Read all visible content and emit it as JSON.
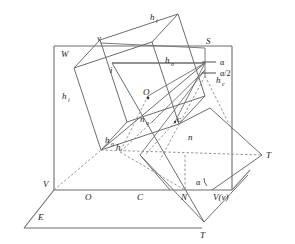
{
  "figure": {
    "background_color": "#ffffff",
    "line_color": "#4d4d4d",
    "dashed_color": "#6e6e6e",
    "label_color": "#1a1a1a",
    "width": 295,
    "height": 244
  },
  "labels": {
    "h_i_top": {
      "base": "h",
      "sub": "i"
    },
    "h_i_left": {
      "base": "h",
      "sub": "i"
    },
    "h_o_upper": {
      "base": "h",
      "sub": "o"
    },
    "h_o_lower": {
      "base": "h",
      "sub": "o"
    },
    "h_c": {
      "base": "h",
      "sub": "c"
    },
    "h_plain": {
      "base": "h",
      "sub": ""
    },
    "n_o": {
      "base": "n",
      "sub": "o"
    },
    "n": {
      "base": "n",
      "sub": ""
    },
    "c": {
      "base": "c",
      "sub": ""
    },
    "i": {
      "base": "i",
      "sub": ""
    },
    "v_small": {
      "base": "v",
      "sub": ""
    },
    "S": {
      "base": "S",
      "sub": ""
    },
    "O_center": {
      "base": "O",
      "sub": ""
    },
    "O_bottom": {
      "base": "O",
      "sub": ""
    },
    "C": {
      "base": "C",
      "sub": ""
    },
    "N": {
      "base": "N",
      "sub": ""
    },
    "W": {
      "base": "W",
      "sub": ""
    },
    "V_left": {
      "base": "V",
      "sub": ""
    },
    "E": {
      "base": "E",
      "sub": ""
    },
    "V_v": {
      "base": "V(v)",
      "sub": ""
    },
    "T_right": {
      "base": "T",
      "sub": ""
    },
    "T_bottom": {
      "base": "T",
      "sub": ""
    },
    "alpha_upper": "α",
    "alpha_half": "α/2",
    "alpha_lower": "α"
  },
  "geometry": {
    "vertical_plane_W": {
      "name": "vertical-projection-plane",
      "corners": [
        [
          54,
          46
        ],
        [
          232,
          46
        ],
        [
          232,
          190
        ],
        [
          54,
          190
        ]
      ]
    },
    "horizontal_plane_E": {
      "name": "horizontal-ground-plane",
      "corners": [
        [
          54,
          190
        ],
        [
          232,
          190
        ],
        [
          202,
          228
        ],
        [
          24,
          228
        ]
      ]
    },
    "rotated_square": {
      "name": "tilted-square-face",
      "corners": [
        [
          100,
          40
        ],
        [
          178,
          14
        ],
        [
          205,
          96
        ],
        [
          127,
          122
        ]
      ]
    },
    "inner_square": {
      "name": "inner-tilted-square",
      "corners": [
        [
          112,
          63
        ],
        [
          190,
          37
        ],
        [
          217,
          119
        ],
        [
          139,
          145
        ]
      ]
    },
    "right_triangle_T": {
      "name": "right-projection-triangle",
      "vertices": [
        [
          210,
          108
        ],
        [
          262,
          155
        ],
        [
          210,
          200
        ]
      ]
    },
    "bottom_triangle_T": {
      "name": "bottom-projection-triangle",
      "vertices": [
        [
          140,
          155
        ],
        [
          204,
          222
        ],
        [
          248,
          175
        ]
      ]
    }
  },
  "points": {
    "S": [
      205,
      48
    ],
    "v": [
      100,
      43
    ],
    "i": [
      115,
      70
    ],
    "O_center": [
      148,
      96
    ],
    "c": [
      175,
      122
    ],
    "n_o": [
      152,
      122
    ],
    "N": [
      185,
      190
    ],
    "C": [
      140,
      190
    ],
    "O_bottom": [
      88,
      190
    ],
    "V": [
      54,
      190
    ],
    "V_v": [
      212,
      190
    ]
  }
}
